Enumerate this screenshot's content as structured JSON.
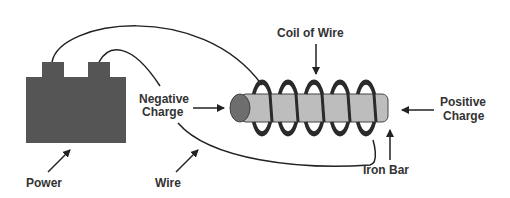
{
  "diagram": {
    "labels": {
      "power": "Power",
      "wire": "Wire",
      "negative_line1": "Negative",
      "negative_line2": "Charge",
      "coil": "Coil of Wire",
      "positive_line1": "Positive",
      "positive_line2": "Charge",
      "iron_bar": "Iron Bar"
    },
    "colors": {
      "battery": "#555555",
      "bar": "#bdbdbd",
      "bar_end": "#6e6e6e",
      "coil": "#2b2b2b",
      "wire": "#222222",
      "text": "#333333"
    },
    "coil_loops": 5
  }
}
